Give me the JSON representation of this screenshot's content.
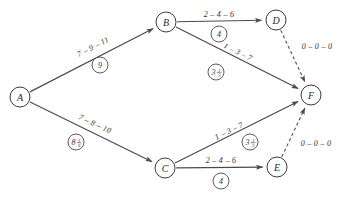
{
  "diagram": {
    "type": "directed-graph",
    "stroke_color": "#4a4a4a",
    "background_color": "#ffffff",
    "nodes": [
      {
        "id": "A",
        "label": "A",
        "x": 20,
        "y": 97,
        "r": 10
      },
      {
        "id": "B",
        "label": "B",
        "x": 166,
        "y": 22,
        "r": 10
      },
      {
        "id": "C",
        "label": "C",
        "x": 165,
        "y": 168,
        "r": 10
      },
      {
        "id": "D",
        "label": "D",
        "x": 276,
        "y": 20,
        "r": 10
      },
      {
        "id": "E",
        "label": "E",
        "x": 277,
        "y": 167,
        "r": 10
      },
      {
        "id": "F",
        "label": "F",
        "x": 311,
        "y": 95,
        "r": 10
      }
    ],
    "edges": [
      {
        "id": "A-B",
        "from": "A",
        "to": "B",
        "style": "solid",
        "time_label": "7 – 9 – 11",
        "time_label_x": 93,
        "time_label_y": 47,
        "time_label_rotation": -27,
        "badge": {
          "whole": "9",
          "num": "",
          "den": "",
          "x": 100,
          "y": 65,
          "r": 8
        }
      },
      {
        "id": "A-C",
        "from": "A",
        "to": "C",
        "style": "solid",
        "time_label": "7 – 8 – 10",
        "time_label_x": 95,
        "time_label_y": 124,
        "time_label_rotation": 25,
        "badge": {
          "whole": "8",
          "num": "1",
          "den": "6",
          "x": 76,
          "y": 142,
          "r": 8
        }
      },
      {
        "id": "B-D",
        "from": "B",
        "to": "D",
        "style": "solid",
        "time_label": "2 – 4 – 6",
        "time_label_x": 219,
        "time_label_y": 14,
        "time_label_rotation": 0,
        "badge": {
          "whole": "4",
          "num": "",
          "den": "",
          "x": 219,
          "y": 34,
          "r": 8
        }
      },
      {
        "id": "B-F",
        "from": "B",
        "to": "F",
        "style": "solid",
        "time_label": "1 – 3 – 7",
        "time_label_x": 238,
        "time_label_y": 52,
        "time_label_rotation": 26,
        "badge": {
          "whole": "3",
          "num": "1",
          "den": "3",
          "x": 216,
          "y": 72,
          "r": 8
        }
      },
      {
        "id": "C-F",
        "from": "C",
        "to": "F",
        "style": "solid",
        "time_label": "1 – 3 – 7",
        "time_label_x": 229,
        "time_label_y": 131,
        "time_label_rotation": -26,
        "badge": {
          "whole": "3",
          "num": "1",
          "den": "3",
          "x": 250,
          "y": 142,
          "r": 8
        }
      },
      {
        "id": "C-E",
        "from": "C",
        "to": "E",
        "style": "solid",
        "time_label": "2 – 4 – 6",
        "time_label_x": 221,
        "time_label_y": 160,
        "time_label_rotation": 0,
        "badge": {
          "whole": "4",
          "num": "",
          "den": "",
          "x": 221,
          "y": 181,
          "r": 8
        }
      },
      {
        "id": "D-F",
        "from": "D",
        "to": "F",
        "style": "dashed",
        "time_label": "0 – 0 – 0",
        "time_label_x": 317,
        "time_label_y": 46,
        "time_label_rotation": 0,
        "badge": null
      },
      {
        "id": "E-F",
        "from": "E",
        "to": "F",
        "style": "dashed",
        "time_label": "0 – 0 – 0",
        "time_label_x": 316,
        "time_label_y": 143,
        "time_label_rotation": 0,
        "badge": null
      }
    ]
  }
}
